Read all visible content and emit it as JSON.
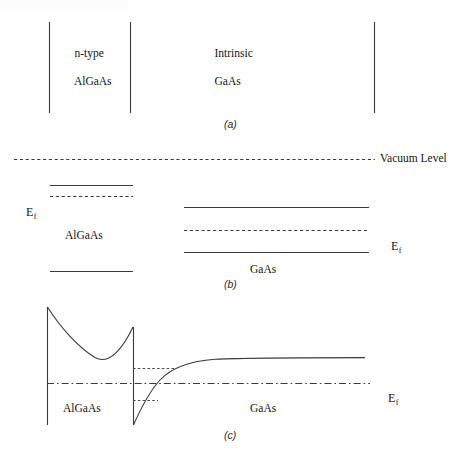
{
  "figure": {
    "stroke_color": "#3a3a3a",
    "background": "#ffffff"
  },
  "panel_a": {
    "caption": "(a)",
    "left_material": "n-type\nAlGaAs",
    "left_material_line1": "n-type",
    "left_material_line2": "AlGaAs",
    "right_material_line1": "Intrinsic",
    "right_material_line2": "GaAs",
    "boundaries": [
      {
        "name": "left-edge",
        "x": 49,
        "y1": 22,
        "y2": 113
      },
      {
        "name": "interface",
        "x": 130,
        "y1": 22,
        "y2": 113
      },
      {
        "name": "right-edge",
        "x": 374,
        "y1": 22,
        "y2": 113
      }
    ]
  },
  "panel_b": {
    "caption": "(b)",
    "vacuum_level_label": "Vacuum Level",
    "fermi_label_left": "E",
    "fermi_sub_left": "f",
    "fermi_label_right": "E",
    "fermi_sub_right": "f",
    "algaas_label": "AlGaAs",
    "gaas_label": "GaAs",
    "levels": [
      {
        "name": "vacuum-level",
        "style": "dashed",
        "x1": 14,
        "x2": 375,
        "y": 159
      },
      {
        "name": "algaas-conduction-band",
        "style": "solid",
        "x1": 50,
        "x2": 133,
        "y": 185
      },
      {
        "name": "algaas-fermi-level",
        "style": "dashed",
        "x1": 50,
        "x2": 133,
        "y": 196
      },
      {
        "name": "algaas-valence-band",
        "style": "solid",
        "x1": 50,
        "x2": 133,
        "y": 271
      },
      {
        "name": "gaas-conduction-band",
        "style": "solid",
        "x1": 184,
        "x2": 369,
        "y": 207
      },
      {
        "name": "gaas-fermi-level",
        "style": "dashed",
        "x1": 184,
        "x2": 369,
        "y": 230
      },
      {
        "name": "gaas-valence-band",
        "style": "solid",
        "x1": 184,
        "x2": 369,
        "y": 252
      }
    ]
  },
  "panel_c": {
    "caption": "(c)",
    "fermi_label": "E",
    "fermi_sub": "f",
    "algaas_label": "AlGaAs",
    "gaas_label": "GaAs",
    "fermi_line": {
      "style": "dash-dot",
      "x1": 47,
      "x2": 370,
      "y": 383
    },
    "algaas_left_edge": {
      "x": 47,
      "y1": 307,
      "y2": 425
    },
    "interface_drop": {
      "x": 133,
      "y1": 327,
      "y2": 425
    },
    "barrier_peak": {
      "x": 47,
      "y": 307
    },
    "barrier_minimum": {
      "x": 95,
      "y": 358
    },
    "notch_peak": {
      "x": 133,
      "y": 327
    },
    "quantum_well_bottom": {
      "x": 133,
      "y": 425
    },
    "gaas_asymptote_y": 358,
    "curve_end_x": 365,
    "guide_lines": [
      {
        "name": "upper-subband-guide",
        "style": "dashed",
        "x1": 133,
        "x2": 175,
        "y": 368
      },
      {
        "name": "lower-subband-guide",
        "style": "dashed",
        "x1": 133,
        "x2": 158,
        "y": 400
      }
    ]
  }
}
